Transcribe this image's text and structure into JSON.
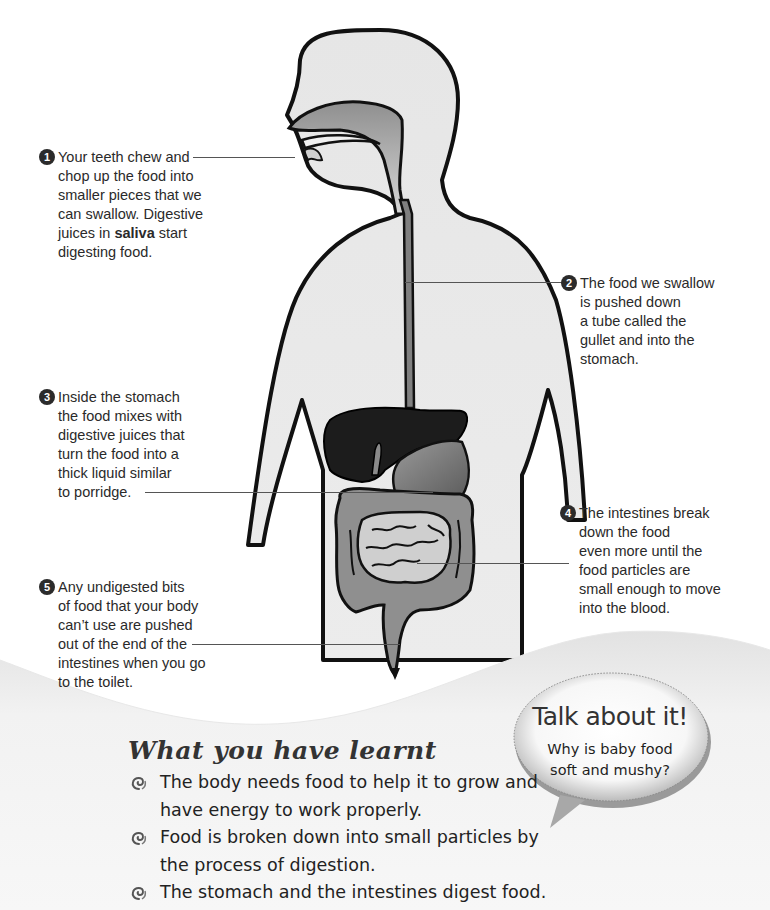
{
  "diagram": {
    "callouts": [
      {
        "number": "1",
        "lines": [
          "Your teeth chew and",
          "chop up the food into",
          "smaller pieces that we",
          "can swallow. Digestive"
        ],
        "last_line_prefix": "juices in ",
        "bold_term": "saliva",
        "last_line_suffix": " start",
        "final_line": "digesting food.",
        "points_to": "teeth"
      },
      {
        "number": "2",
        "lines": [
          "The food we swallow",
          "is pushed down",
          "a tube called the",
          "gullet and into the",
          "stomach."
        ],
        "points_to": "gullet"
      },
      {
        "number": "3",
        "lines": [
          "Inside the stomach",
          "the food mixes with",
          "digestive juices that",
          "turn the food into a",
          "thick liquid similar",
          "to porridge."
        ],
        "points_to": "stomach"
      },
      {
        "number": "4",
        "lines": [
          "The intestines break",
          "down the food",
          "even more until the",
          "food particles are",
          "small enough to move",
          "into the blood."
        ],
        "points_to": "small intestine"
      },
      {
        "number": "5",
        "lines": [
          "Any undigested bits",
          "of food that your body",
          "can’t use are pushed",
          "out of the end of the",
          "intestines when you go",
          "to the toilet."
        ],
        "points_to": "large intestine end"
      }
    ]
  },
  "talk_about_it": {
    "title": "Talk about it!",
    "question_lines": [
      "Why is baby food",
      "soft and mushy?"
    ]
  },
  "what_you_have_learnt": {
    "title": "What you have learnt",
    "bullet_icon": "swirl-icon",
    "items": [
      {
        "lines": [
          "The body needs food to help it to grow and",
          "have energy to work properly."
        ]
      },
      {
        "lines": [
          "Food is broken down into small particles by",
          "the process of digestion."
        ]
      },
      {
        "lines": [
          "The stomach and the intestines digest food."
        ]
      }
    ]
  },
  "colors": {
    "body_fill": "#e6e6e6",
    "outline": "#111111",
    "liver": "#1c1c1c",
    "organ_gray": "#8a8a8a",
    "small_intestine": "#c9c9c9",
    "wave": "#efefef",
    "text": "#2a2a2a"
  }
}
